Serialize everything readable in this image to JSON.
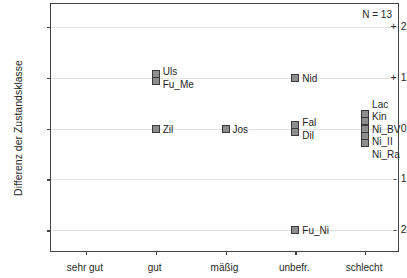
{
  "chart_data": {
    "type": "scatter",
    "title": "",
    "xlabel": "",
    "ylabel": "Differenz der Zustandsklasse",
    "annotation": "N = 13",
    "grid": true,
    "legend": "none",
    "categories": [
      "sehr gut",
      "gut",
      "mäßig",
      "unbefr.",
      "schlecht"
    ],
    "yticks": [
      "+ 2",
      "+ 1",
      "0",
      "- 1",
      "- 2"
    ],
    "ytick_values": [
      2,
      1,
      0,
      -1,
      -2
    ],
    "ylim": [
      -2.45,
      2.45
    ],
    "points": [
      {
        "label": "Uls",
        "category": "gut",
        "x": 1,
        "y": 1.07
      },
      {
        "label": "Fu_Me",
        "category": "gut",
        "x": 1,
        "y": 0.93
      },
      {
        "label": "Zil",
        "category": "gut",
        "x": 1,
        "y": 0.0
      },
      {
        "label": "Jos",
        "category": "mäßig",
        "x": 2,
        "y": 0.0
      },
      {
        "label": "Nid",
        "category": "unbefr.",
        "x": 3,
        "y": 1.0
      },
      {
        "label": "Fal",
        "category": "unbefr.",
        "x": 3,
        "y": 0.07
      },
      {
        "label": "Dil",
        "category": "unbefr.",
        "x": 3,
        "y": -0.07
      },
      {
        "label": "Fu_Ni",
        "category": "unbefr.",
        "x": 3,
        "y": -2.0
      },
      {
        "label": "Lac",
        "category": "schlecht",
        "x": 4,
        "y": 0.28
      },
      {
        "label": "Kin",
        "category": "schlecht",
        "x": 4,
        "y": 0.14
      },
      {
        "label": "Ni_BV",
        "category": "schlecht",
        "x": 4,
        "y": 0.0
      },
      {
        "label": "Ni_II",
        "category": "schlecht",
        "x": 4,
        "y": -0.14
      },
      {
        "label": "Ni_Ra",
        "category": "schlecht",
        "x": 4,
        "y": -0.28
      }
    ],
    "marker_fill": "#8d8d8d",
    "marker_edge": "#3a3a3a",
    "grid_color": "#e2e2e2",
    "axis_color": "#444444"
  }
}
